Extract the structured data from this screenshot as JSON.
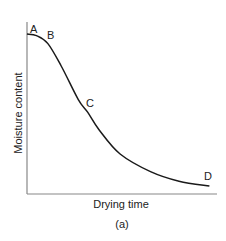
{
  "chart_data": {
    "type": "line",
    "title": "",
    "caption": "(a)",
    "xlabel": "Drying time",
    "ylabel": "Moisture content",
    "grid": false,
    "legend": null,
    "axis_ticks": "none",
    "series": [
      {
        "name": "drying curve",
        "description": "Moisture content vs drying time: initial plateau A-B, steep constant-rate fall through C, then falling-rate tail toward D",
        "points_normalized": [
          {
            "x": 0.0,
            "y": 1.0
          },
          {
            "x": 0.05,
            "y": 0.99
          },
          {
            "x": 0.11,
            "y": 0.94
          },
          {
            "x": 0.18,
            "y": 0.8
          },
          {
            "x": 0.27,
            "y": 0.59
          },
          {
            "x": 0.32,
            "y": 0.51
          },
          {
            "x": 0.38,
            "y": 0.4
          },
          {
            "x": 0.49,
            "y": 0.25
          },
          {
            "x": 0.65,
            "y": 0.14
          },
          {
            "x": 0.8,
            "y": 0.08
          },
          {
            "x": 0.96,
            "y": 0.05
          }
        ]
      }
    ],
    "annotations": [
      {
        "label": "A",
        "x": 0.03,
        "y": 1.04
      },
      {
        "label": "B",
        "x": 0.13,
        "y": 0.98
      },
      {
        "label": "C",
        "x": 0.33,
        "y": 0.56
      },
      {
        "label": "D",
        "x": 0.97,
        "y": 0.1
      }
    ]
  },
  "labels": {
    "A": "A",
    "B": "B",
    "C": "C",
    "D": "D",
    "xlabel": "Drying time",
    "ylabel": "Moisture content",
    "caption": "(a)"
  }
}
